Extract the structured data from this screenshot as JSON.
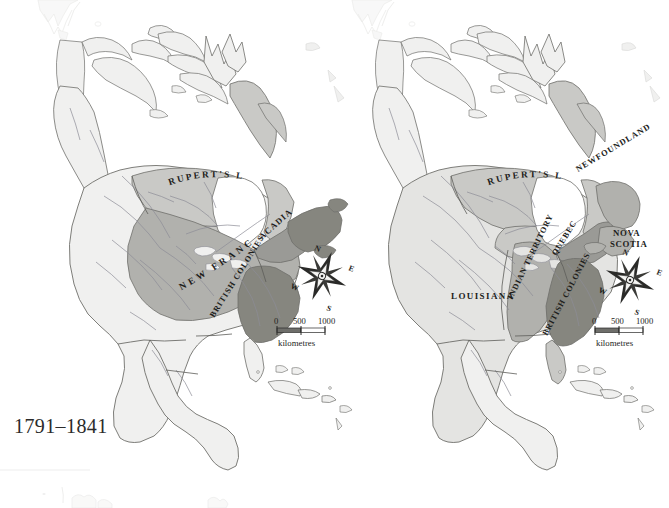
{
  "figure": {
    "caption": "1791–1841",
    "background_color": "#ffffff",
    "panel_count": 2
  },
  "palette": {
    "unclaimed_land": "#f0f0ef",
    "light_territory": "#e4e4e2",
    "medium_territory": "#c9c9c6",
    "mid_dark_territory": "#b1b1ad",
    "dark_territory": "#9a9a96",
    "darkest_territory": "#86867f",
    "coastline": "#6f6f6b",
    "river": "#8d8d96",
    "border": "#5d5d59",
    "label_text": "#1d1d1b",
    "faint_outline": "#d8d8d6",
    "compass_dark": "#2a2a28",
    "compass_light": "#f4f4f2",
    "scale_fill": "#6e6e6a"
  },
  "left_map": {
    "name": "north-america-pre-1763",
    "labels": [
      {
        "text": "RUPERT'S LAND",
        "style": "curved-arc",
        "letter_spacing": 2.2,
        "font_size": 9.2
      },
      {
        "text": "NEW  FRANCE",
        "style": "curved-arc-rising",
        "letter_spacing": 3.4,
        "font_size": 9.4
      },
      {
        "text": "ACADIA",
        "style": "rotated",
        "rotation": -42,
        "letter_spacing": 1.2,
        "font_size": 8.6
      },
      {
        "text": "BRITISH COLONIES",
        "style": "rotated",
        "rotation": -58,
        "letter_spacing": 1.0,
        "font_size": 8.2
      }
    ],
    "compass": {
      "north": "N",
      "east": "E",
      "south": "S",
      "west": "W",
      "rotation": 22
    },
    "scale": {
      "ticks": [
        "0",
        "500",
        "1000"
      ],
      "unit_label": "kilometres"
    }
  },
  "right_map": {
    "name": "north-america-post-1763",
    "labels": [
      {
        "text": "RUPERT'S LAND",
        "style": "curved-arc",
        "letter_spacing": 2.2,
        "font_size": 9.2
      },
      {
        "text": "NEWFOUNDLAND",
        "style": "rotated",
        "rotation": -31,
        "letter_spacing": 1.0,
        "font_size": 8.4
      },
      {
        "text": "INDIAN TERRITORY",
        "style": "rotated",
        "rotation": -64,
        "letter_spacing": 0.8,
        "font_size": 8.2
      },
      {
        "text": "QUEBEC",
        "style": "rotated",
        "rotation": -58,
        "letter_spacing": 0.8,
        "font_size": 8.2
      },
      {
        "text": "NOVA",
        "style": "horizontal",
        "rotation": 0,
        "letter_spacing": 0.6,
        "font_size": 8.8
      },
      {
        "text": "SCOTIA",
        "style": "horizontal",
        "rotation": 0,
        "letter_spacing": 0.6,
        "font_size": 8.8
      },
      {
        "text": "BRITISH COLONIES",
        "style": "rotated",
        "rotation": -62,
        "letter_spacing": 0.8,
        "font_size": 8.2
      },
      {
        "text": "LOUISIANA",
        "style": "horizontal",
        "rotation": 0,
        "letter_spacing": 1.4,
        "font_size": 9.0
      }
    ],
    "compass": {
      "north": "N",
      "east": "E",
      "south": "S",
      "west": "W",
      "rotation": 22
    },
    "scale": {
      "ticks": [
        "0",
        "500",
        "1000"
      ],
      "unit_label": "kilometres"
    }
  }
}
